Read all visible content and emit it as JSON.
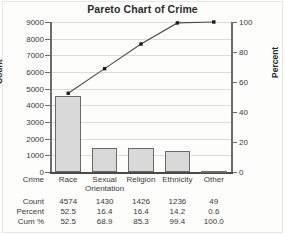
{
  "chart_data": {
    "type": "bar",
    "title": "Pareto Chart of Crime",
    "xlabel": "Crime",
    "ylabel": "Count",
    "y2label": "Percent",
    "categories": [
      "Race",
      "Sexual Orientation",
      "Religion",
      "Ethnicity",
      "Other"
    ],
    "grid": true,
    "ylim": [
      0,
      9000
    ],
    "y2lim": [
      0,
      100
    ],
    "yticks": [
      0,
      1000,
      2000,
      3000,
      4000,
      5000,
      6000,
      7000,
      8000,
      9000
    ],
    "y2ticks": [
      0,
      20,
      40,
      60,
      80,
      100
    ],
    "series": [
      {
        "name": "Count",
        "type": "bar",
        "values": [
          4574,
          1430,
          1426,
          1236,
          49
        ]
      },
      {
        "name": "Cum %",
        "type": "line",
        "axis": "y2",
        "values": [
          52.5,
          68.9,
          85.3,
          99.4,
          100.0
        ]
      }
    ],
    "percent": [
      52.5,
      16.4,
      16.4,
      14.2,
      0.6
    ]
  },
  "table": {
    "header_label": "Crime",
    "columns": [
      "Race",
      "Sexual Orientation",
      "Religion",
      "Ethnicity",
      "Other"
    ],
    "rows": [
      {
        "label": "Count",
        "values": [
          "4574",
          "1430",
          "1426",
          "1236",
          "49"
        ]
      },
      {
        "label": "Percent",
        "values": [
          "52.5",
          "16.4",
          "16.4",
          "14.2",
          "0.6"
        ]
      },
      {
        "label": "Cum %",
        "values": [
          "52.5",
          "68.9",
          "85.3",
          "99.4",
          "100.0"
        ]
      }
    ]
  },
  "colors": {
    "bar_fill": "#d9d9d9",
    "bar_border": "#6a6a6a",
    "line": "#4a4a4a",
    "marker": "#1c1c1c",
    "grid": "#dcdcdc",
    "axis": "#6d6d6d",
    "text": "#3a3a3a",
    "background": "#fdfdfb"
  }
}
